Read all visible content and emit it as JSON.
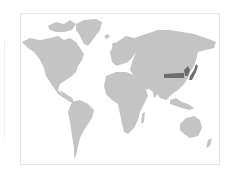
{
  "map": {
    "type": "world-choropleth",
    "colors": {
      "land": "#c4c4c4",
      "highlight": "#6e6e6e",
      "frame_border": "#e6e6e6",
      "background": "#ffffff"
    },
    "highlighted_regions": [
      "Northern China band",
      "Korea",
      "Japan"
    ]
  }
}
